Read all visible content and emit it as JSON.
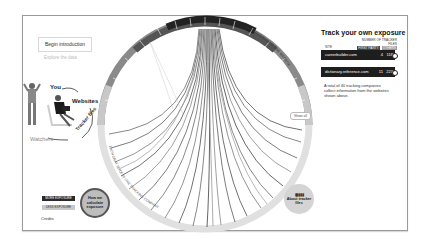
{
  "intro": {
    "begin_label": "Begin introduction",
    "explore_label": "Explore the data",
    "diagram": {
      "you": "You",
      "websites": "Websites",
      "tracker_files": "Tracker files",
      "watchers": "Watchers"
    }
  },
  "chord": {
    "top_arc_label": "EACH RED SLICE IS ONE WEBSITE",
    "bottom_arc_label": "EACH GRAY SLICE IS ONE TRACKING COMPANY",
    "show_all_label": "Show all"
  },
  "tracker": {
    "title": "Track your own exposure",
    "column_header": "NUMBER OF TRACKER FILES",
    "col_first_party": "FIRST PARTY",
    "col_others": "OTHERS",
    "site_label": "SITE",
    "rows": [
      {
        "site": "careerbuilder.com",
        "first_party": "4",
        "others": "118"
      },
      {
        "site": "dictionary.reference.com",
        "first_party": "11",
        "others": "223"
      }
    ],
    "description": "A total of 40 tracking companies collect information from the websites shown above."
  },
  "legend": {
    "more_exposure": "MORE EXPOSURE",
    "less_exposure": "LESS EXPOSURE"
  },
  "buttons": {
    "how_calc": "How we calculate exposure",
    "about_tracker": "About tracker files",
    "credits": "Credits"
  },
  "colors": {
    "dark": "#1e1e1e",
    "mid_gray": "#888888",
    "light_gray": "#d4d4d4"
  }
}
